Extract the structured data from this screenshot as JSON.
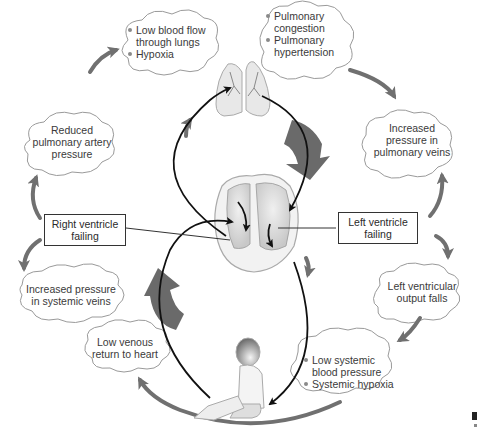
{
  "diagram": {
    "colors": {
      "cloud_stroke": "#9a9a9a",
      "cycle_arrow": "#707070",
      "big_arrow": "#6a6a6a",
      "circulation_line": "#111111",
      "organ_fill": "#d9d9d9"
    },
    "boxes": {
      "right_ventricle": {
        "line1": "Right ventricle",
        "line2": "failing"
      },
      "left_ventricle": {
        "line1": "Left ventricle",
        "line2": "failing"
      }
    },
    "clouds": {
      "lungs_low_flow": {
        "bullets": [
          {
            "line1": "Low blood flow",
            "line2": "through lungs"
          },
          {
            "line1": "Hypoxia",
            "line2": ""
          }
        ]
      },
      "pulmonary_congestion": {
        "bullets": [
          {
            "line1": "Pulmonary",
            "line2": "congestion"
          },
          {
            "line1": "Pulmonary",
            "line2": "hypertension"
          }
        ]
      },
      "reduced_pa_pressure": {
        "line1": "Reduced",
        "line2": "pulmonary artery",
        "line3": "pressure"
      },
      "increased_pv_pressure": {
        "line1": "Increased",
        "line2": "pressure in",
        "line3": "pulmonary veins"
      },
      "increased_sv_pressure": {
        "line1": "Increased pressure",
        "line2": "in systemic veins"
      },
      "lv_output_falls": {
        "line1": "Left ventricular",
        "line2": "output falls"
      },
      "low_venous_return": {
        "line1": "Low venous",
        "line2": "return to heart"
      },
      "low_systemic_bp": {
        "bullets": [
          {
            "line1": "Low systemic",
            "line2": "blood pressure"
          },
          {
            "line1": "Systemic hypoxia",
            "line2": ""
          }
        ]
      }
    },
    "illustrations": [
      "lungs",
      "heart-cross-section",
      "seated-child"
    ]
  }
}
